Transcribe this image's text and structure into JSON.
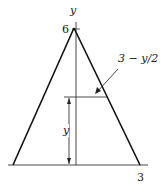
{
  "diagram": {
    "type": "triangle-cross-section",
    "labels": {
      "y_axis": "y",
      "apex_value": "6",
      "base_value": "3",
      "width_expression": "3 − y/2",
      "height_variable": "y"
    },
    "colors": {
      "stroke": "#222222",
      "background": "#ffffff"
    }
  }
}
